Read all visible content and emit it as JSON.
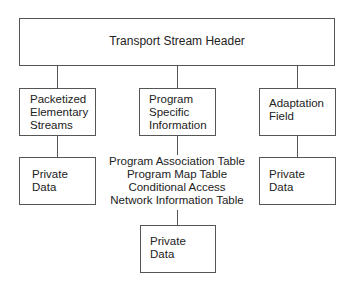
{
  "diagram": {
    "header": {
      "label": "Transport Stream Header"
    },
    "pes": {
      "lines": [
        "Packetized",
        "Elementary",
        "Streams"
      ]
    },
    "psi": {
      "lines": [
        "Program",
        "Specific",
        "Information"
      ]
    },
    "adaptation": {
      "lines": [
        "Adaptation",
        "Field"
      ]
    },
    "pes_private": {
      "lines": [
        "Private",
        "Data"
      ]
    },
    "adaptation_private": {
      "lines": [
        "Private",
        "Data"
      ]
    },
    "psi_tables": [
      "Program Association Table",
      "Program Map Table",
      "Conditional Access",
      "Network Information Table"
    ],
    "psi_private": {
      "lines": [
        "Private",
        "Data"
      ]
    }
  }
}
